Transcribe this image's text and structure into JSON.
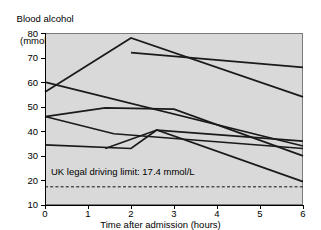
{
  "chart_data": {
    "type": "line",
    "title": "Blood alcohol (mmol/L)",
    "title_line1": "Blood alcohol",
    "title_line2": "(mmol/L)",
    "xlabel": "Time after admission (hours)",
    "ylabel": "Blood alcohol (mmol/L)",
    "xlim": [
      0,
      6
    ],
    "ylim": [
      10,
      80
    ],
    "grid": false,
    "legend": "none",
    "xticks": [
      0,
      1,
      2,
      3,
      4,
      5,
      6
    ],
    "yticks": [
      10,
      20,
      30,
      40,
      50,
      60,
      70,
      80
    ],
    "xtick_labels": [
      "0",
      "1",
      "2",
      "3",
      "4",
      "5",
      "6"
    ],
    "ytick_labels": [
      "10",
      "20",
      "30",
      "40",
      "50",
      "60",
      "70",
      "80"
    ],
    "annotations": [
      {
        "name": "uk-legal-driving-limit",
        "text": "UK legal driving limit: 17.4 mmol/L",
        "type": "horizontal-reference-line",
        "value": 17.4,
        "style": "dashed"
      }
    ],
    "series": [
      {
        "name": "patient-1",
        "x": [
          0,
          2,
          6
        ],
        "values": [
          56,
          78,
          54
        ]
      },
      {
        "name": "patient-2",
        "x": [
          0,
          6
        ],
        "values": [
          60,
          34
        ]
      },
      {
        "name": "patient-3",
        "x": [
          2,
          6
        ],
        "values": [
          72,
          66
        ]
      },
      {
        "name": "patient-4",
        "x": [
          0,
          1.6,
          6
        ],
        "values": [
          46,
          39,
          33
        ]
      },
      {
        "name": "patient-5",
        "x": [
          0,
          1.4,
          3,
          6
        ],
        "values": [
          46,
          49.5,
          49,
          30
        ]
      },
      {
        "name": "patient-6",
        "x": [
          0,
          2,
          2.6,
          6
        ],
        "values": [
          34.5,
          33,
          40.5,
          19.5
        ]
      },
      {
        "name": "patient-7",
        "x": [
          1.4,
          2.6,
          6
        ],
        "values": [
          33,
          40.5,
          36
        ]
      }
    ],
    "colors": {
      "plot_background": "#d9d9d9",
      "line": "#1a1a1a",
      "axis": "#000000",
      "page_background": "#ffffff"
    }
  }
}
